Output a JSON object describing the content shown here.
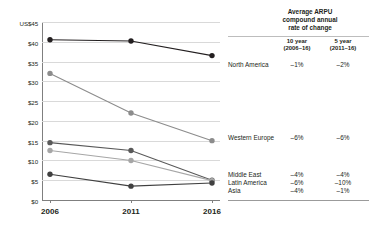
{
  "chart_data": {
    "type": "line",
    "title": "",
    "subtitle": "",
    "xlabel": "",
    "ylabel": "US$",
    "x": [
      "2006",
      "2011",
      "2016"
    ],
    "categories": [
      "2006",
      "2011",
      "2016"
    ],
    "ylim": [
      0,
      45
    ],
    "yticks": [
      0,
      5,
      10,
      15,
      20,
      25,
      30,
      35,
      40,
      45
    ],
    "ytick_labels": [
      "$0",
      "$5",
      "$10",
      "$15",
      "$20",
      "$25",
      "$30",
      "$35",
      "$40",
      "US$45"
    ],
    "grid": true,
    "legend_position": "right",
    "series": [
      {
        "name": "North America",
        "values": [
          40.5,
          40.2,
          36.5
        ],
        "color": "#231f20"
      },
      {
        "name": "Western Europe",
        "values": [
          32.0,
          22.0,
          15.0
        ],
        "color": "#8c8c8c"
      },
      {
        "name": "Middle East",
        "values": [
          14.5,
          12.5,
          5.0
        ],
        "color": "#595959"
      },
      {
        "name": "Latin America",
        "values": [
          12.5,
          10.0,
          4.9
        ],
        "color": "#a6a6a6"
      },
      {
        "name": "Asia",
        "values": [
          6.5,
          3.5,
          4.3
        ],
        "color": "#404040"
      }
    ],
    "annotations": [
      {
        "text": "North America",
        "series": "North America"
      },
      {
        "text": "Western Europe",
        "series": "Western Europe"
      },
      {
        "text": "Middle East",
        "series": "Middle East"
      },
      {
        "text": "Latin America",
        "series": "Latin America"
      },
      {
        "text": "Asia",
        "series": "Asia"
      }
    ]
  },
  "axis": {
    "y_unit_label": "US$45",
    "ticks": [
      {
        "label": "US$45",
        "value": 45
      },
      {
        "label": "$40",
        "value": 40
      },
      {
        "label": "$35",
        "value": 35
      },
      {
        "label": "$30",
        "value": 30
      },
      {
        "label": "$25",
        "value": 25
      },
      {
        "label": "$20",
        "value": 20
      },
      {
        "label": "$15",
        "value": 15
      },
      {
        "label": "$10",
        "value": 10
      },
      {
        "label": "$5",
        "value": 5
      },
      {
        "label": "$0",
        "value": 0
      }
    ],
    "x_ticks": [
      {
        "label": "2006",
        "value": 0
      },
      {
        "label": "2011",
        "value": 1
      },
      {
        "label": "2016",
        "value": 2
      }
    ]
  },
  "legend": {
    "heading": "Average ARPU compound annual rate of change",
    "heading_line1": "Average ARPU",
    "heading_line2": "compound annual",
    "heading_line3": "rate of change",
    "columns": [
      {
        "title": "10 year",
        "period": "(2006–16)"
      },
      {
        "title": "5 year",
        "period": "(2011–16)"
      }
    ],
    "col1_title": "10 year",
    "col1_period": "(2006–16)",
    "col2_title": "5 year",
    "col2_period": "(2011–16)",
    "rows": [
      {
        "label": "North America",
        "ten_year": "–1%",
        "five_year": "–2%"
      },
      {
        "label": "Western Europe",
        "ten_year": "–6%",
        "five_year": "–6%"
      },
      {
        "label": "Middle East",
        "ten_year": "–4%",
        "five_year": "–4%"
      },
      {
        "label": "Latin America",
        "ten_year": "–6%",
        "five_year": "–10%"
      },
      {
        "label": "Asia",
        "ten_year": "–4%",
        "five_year": "–1%"
      }
    ]
  },
  "colors": {
    "north_america": "#231f20",
    "western_europe": "#8c8c8c",
    "middle_east": "#595959",
    "latin_america": "#a6a6a6",
    "asia": "#404040",
    "grid": "#d9d9d9",
    "axis": "#7f7f7f"
  }
}
